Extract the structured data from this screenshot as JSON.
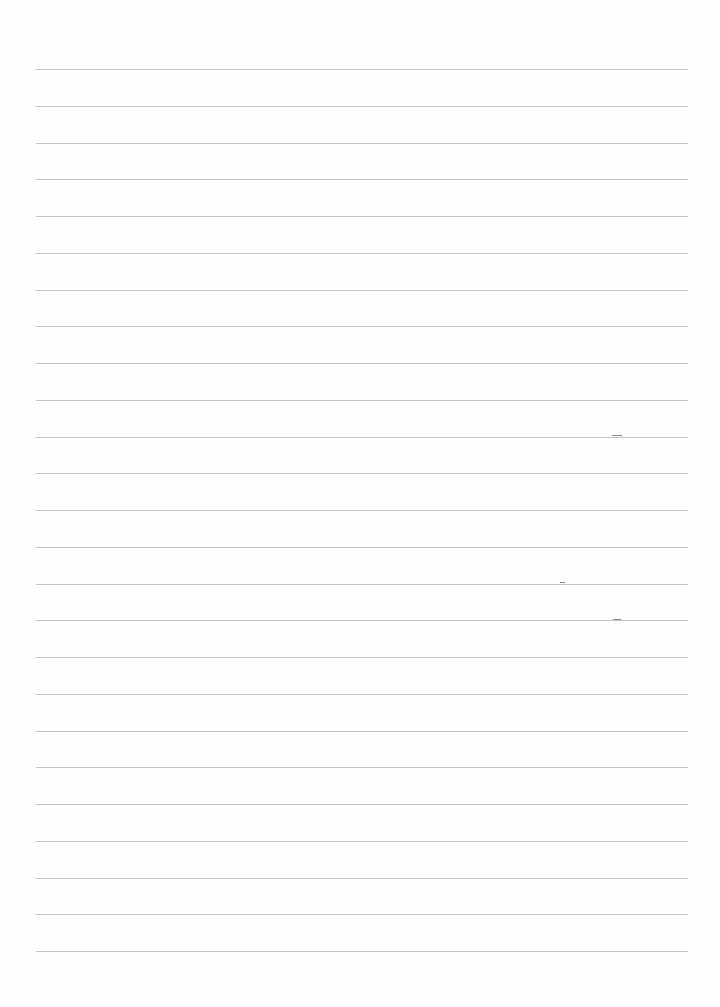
{
  "page": {
    "type": "lined-paper",
    "background": "#fefefe",
    "rule_color": "#c4c4c4",
    "rule_count": 25,
    "first_rule_y": 69,
    "rule_spacing": 36.75,
    "rule_left": 36,
    "rule_right": 688
  },
  "marks": [
    {
      "x": 612,
      "y": 435,
      "w": 10
    },
    {
      "x": 560,
      "y": 582,
      "w": 5
    },
    {
      "x": 613,
      "y": 619,
      "w": 8
    }
  ]
}
